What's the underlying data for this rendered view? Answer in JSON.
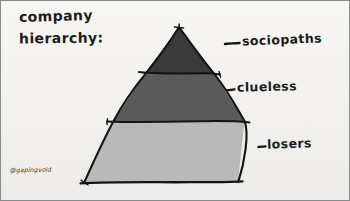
{
  "artwork": {
    "title_line1": "company",
    "title_line2": "hierarchy:",
    "signature": "@gapingvoid",
    "background_color": "#f6f4f0",
    "ink_color": "#1c1c1c",
    "border_color": "#8a8a8a"
  },
  "pyramid": {
    "apex": {
      "x": 178,
      "y": 26
    },
    "base_left": {
      "x": 83,
      "y": 182
    },
    "base_right": {
      "x": 237,
      "y": 182
    },
    "divider_1_y": 72,
    "divider_2_y": 120,
    "tiers": [
      {
        "name": "top",
        "label": "sociopaths",
        "fill_color": "#3a3a3a",
        "rank": 1
      },
      {
        "name": "middle",
        "label": "clueless",
        "fill_color": "#5a5a5a",
        "rank": 2
      },
      {
        "name": "bottom",
        "label": "losers",
        "fill_color": "#b9b9b9",
        "rank": 3
      }
    ]
  },
  "callouts": [
    {
      "name": "sociopaths-dash",
      "label": "sociopaths"
    },
    {
      "name": "clueless-dash",
      "label": "clueless"
    },
    {
      "name": "losers-dash",
      "label": "losers"
    }
  ]
}
